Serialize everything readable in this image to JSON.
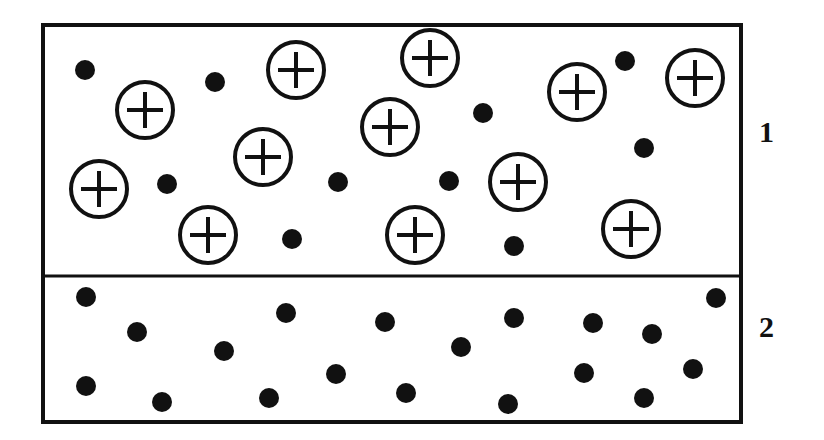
{
  "diagram": {
    "regions": [
      {
        "label": "1",
        "electrons": [
          [
            85,
            70
          ],
          [
            215,
            82
          ],
          [
            338,
            182
          ],
          [
            167,
            184
          ],
          [
            292,
            239
          ],
          [
            483,
            113
          ],
          [
            449,
            181
          ],
          [
            625,
            61
          ],
          [
            644,
            148
          ],
          [
            514,
            246
          ]
        ],
        "positive_ions": [
          [
            145,
            110
          ],
          [
            296,
            70
          ],
          [
            430,
            58
          ],
          [
            263,
            157
          ],
          [
            390,
            127
          ],
          [
            577,
            92
          ],
          [
            695,
            78
          ],
          [
            99,
            189
          ],
          [
            518,
            182
          ],
          [
            208,
            235
          ],
          [
            415,
            235
          ],
          [
            631,
            229
          ]
        ]
      },
      {
        "label": "2",
        "electrons": [
          [
            86,
            297
          ],
          [
            137,
            332
          ],
          [
            286,
            313
          ],
          [
            224,
            351
          ],
          [
            385,
            322
          ],
          [
            461,
            347
          ],
          [
            514,
            318
          ],
          [
            593,
            323
          ],
          [
            652,
            334
          ],
          [
            716,
            298
          ],
          [
            86,
            386
          ],
          [
            162,
            402
          ],
          [
            269,
            398
          ],
          [
            336,
            374
          ],
          [
            406,
            393
          ],
          [
            584,
            373
          ],
          [
            508,
            404
          ],
          [
            644,
            398
          ],
          [
            693,
            369
          ]
        ],
        "positive_ions": []
      }
    ],
    "colors": {
      "ink": "#111111",
      "background": "#ffffff"
    }
  }
}
